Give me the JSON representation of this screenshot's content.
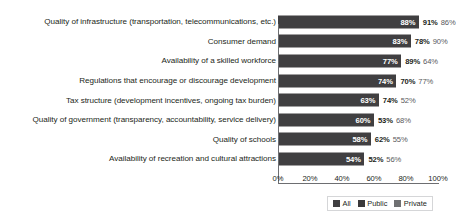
{
  "title": "",
  "colors": {
    "bar": "#403f41",
    "legend_all": "#403f41",
    "legend_public": "#3a393b",
    "legend_private": "#6f7072",
    "axis": "#6d6e71",
    "text": "#231f20"
  },
  "legend": {
    "items": [
      {
        "label": "All",
        "color": "#403f41"
      },
      {
        "label": "Public",
        "color": "#3a393b"
      },
      {
        "label": "Private",
        "color": "#6f7072"
      }
    ]
  },
  "axis": {
    "ticks": [
      "0%",
      "20%",
      "40%",
      "60%",
      "80%",
      "100%"
    ]
  },
  "chart_data": {
    "type": "bar",
    "orientation": "horizontal",
    "title": "",
    "xlabel": "",
    "ylabel": "",
    "xlim": [
      0,
      100
    ],
    "grid": false,
    "legend_position": "bottom-right",
    "bar_series": "All",
    "categories": [
      "Quality of infrastructure (transportation, telecommunications, etc.)",
      "Consumer demand",
      "Availability of a skilled workforce",
      "Regulations that encourage or discourage development",
      "Tax structure (development incentives, ongoing tax burden)",
      "Quality of government (transparency, accountability, service delivery)",
      "Quality of schools",
      "Availability of recreation and cultural attractions"
    ],
    "series": [
      {
        "name": "All",
        "values": [
          88,
          83,
          77,
          74,
          63,
          60,
          58,
          54
        ]
      },
      {
        "name": "Public",
        "values": [
          91,
          78,
          89,
          70,
          74,
          53,
          62,
          52
        ]
      },
      {
        "name": "Private",
        "values": [
          86,
          90,
          64,
          77,
          52,
          68,
          55,
          56
        ]
      }
    ],
    "rows": [
      {
        "category": "Quality of infrastructure (transportation, telecommunications, etc.)",
        "all": 88,
        "all_label": "88%",
        "public_label": "91%",
        "private_label": "86%"
      },
      {
        "category": "Consumer demand",
        "all": 83,
        "all_label": "83%",
        "public_label": "78%",
        "private_label": "90%"
      },
      {
        "category": "Availability of a skilled workforce",
        "all": 77,
        "all_label": "77%",
        "public_label": "89%",
        "private_label": "64%"
      },
      {
        "category": "Regulations that encourage or discourage development",
        "all": 74,
        "all_label": "74%",
        "public_label": "70%",
        "private_label": "77%"
      },
      {
        "category": "Tax structure (development incentives, ongoing tax burden)",
        "all": 63,
        "all_label": "63%",
        "public_label": "74%",
        "private_label": "52%"
      },
      {
        "category": "Quality of government (transparency, accountability, service delivery)",
        "all": 60,
        "all_label": "60%",
        "public_label": "53%",
        "private_label": "68%"
      },
      {
        "category": "Quality of schools",
        "all": 58,
        "all_label": "58%",
        "public_label": "62%",
        "private_label": "55%"
      },
      {
        "category": "Availability of recreation and cultural attractions",
        "all": 54,
        "all_label": "54%",
        "public_label": "52%",
        "private_label": "56%"
      }
    ]
  }
}
